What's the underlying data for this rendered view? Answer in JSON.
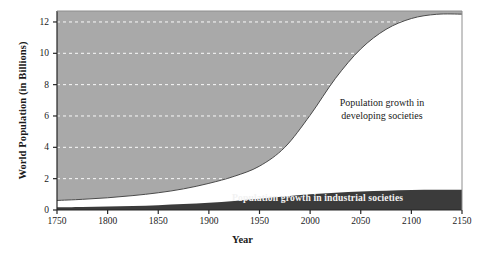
{
  "chart_data": {
    "type": "area",
    "title": "",
    "subtitle": "",
    "xlabel": "Year",
    "ylabel": "World Population (in Billions)",
    "xlim": [
      1750,
      2150
    ],
    "ylim": [
      0,
      12.7
    ],
    "xticks": [
      1750,
      1800,
      1850,
      1900,
      1950,
      2000,
      2050,
      2100,
      2150
    ],
    "yticks": [
      0,
      2,
      4,
      6,
      8,
      10,
      12
    ],
    "grid": "horizontal-dashed-white",
    "legend_position": "inline-annotations",
    "stacked": true,
    "colors": {
      "industrial_band": "#3b3b3b",
      "developing_band": "#ffffff",
      "background_fill": "#a9a9a9",
      "gridline": "#ffffff",
      "axis": "#262626",
      "text": "#1a1a1a",
      "inverse_text": "#f2f2f2"
    },
    "annotations": [
      {
        "id": "developing",
        "line1": "Population growth in",
        "line2": "developing societies"
      },
      {
        "id": "industrial",
        "text": "Population growth in industrial societies"
      }
    ],
    "x": [
      1750,
      1775,
      1800,
      1825,
      1850,
      1875,
      1900,
      1925,
      1950,
      1975,
      2000,
      2025,
      2050,
      2075,
      2100,
      2125,
      2150
    ],
    "series": [
      {
        "name": "Population growth in industrial societies",
        "values": [
          0.17,
          0.19,
          0.22,
          0.26,
          0.31,
          0.38,
          0.47,
          0.58,
          0.72,
          0.86,
          1.0,
          1.1,
          1.18,
          1.23,
          1.27,
          1.29,
          1.3
        ]
      },
      {
        "name": "Population growth in developing societies",
        "values": [
          0.44,
          0.49,
          0.56,
          0.66,
          0.79,
          0.97,
          1.23,
          1.57,
          2.08,
          3.14,
          5.05,
          7.3,
          9.1,
          10.3,
          10.95,
          11.2,
          11.2
        ]
      }
    ],
    "total_values": [
      0.61,
      0.68,
      0.78,
      0.92,
      1.1,
      1.35,
      1.7,
      2.15,
      2.8,
      4.0,
      6.05,
      8.4,
      10.28,
      11.53,
      12.22,
      12.49,
      12.5
    ]
  }
}
